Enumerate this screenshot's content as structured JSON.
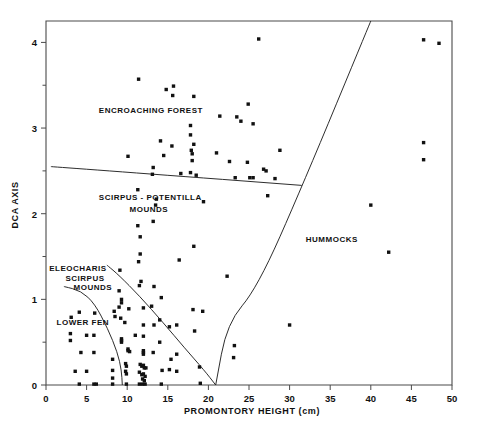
{
  "chart_data": {
    "type": "scatter",
    "title": "",
    "xlabel": "PROMONTORY HEIGHT (cm)",
    "ylabel": "DCA AXIS",
    "xlim": [
      0,
      50
    ],
    "ylim": [
      0,
      4.25
    ],
    "grid": false,
    "legend_position": "none",
    "xticks": [
      0,
      5,
      10,
      15,
      20,
      25,
      30,
      35,
      40,
      45,
      50
    ],
    "xtick_labels": [
      "0",
      "5",
      "10",
      "15",
      "20",
      "25",
      "30",
      "35",
      "40",
      "45",
      "50"
    ],
    "yticks": [
      0,
      1,
      2,
      3,
      4
    ],
    "ytick_labels": [
      "0",
      "1",
      "2",
      "3",
      "4"
    ],
    "yminorticks": [
      0.5,
      1.5,
      2.5,
      3.5
    ],
    "marker": "filled-square",
    "marker_color": "#111111",
    "annotations": [
      {
        "text": "ENCROACHING FOREST",
        "x": 6.5,
        "y": 3.18,
        "align": "start"
      },
      {
        "text": "SCIRPUS - POTENTILLA",
        "x": 6.5,
        "y": 2.16,
        "align": "start"
      },
      {
        "text": "MOUNDS",
        "x": 10.3,
        "y": 2.02,
        "align": "start"
      },
      {
        "text": "ELEOCHARIS",
        "x": 0.4,
        "y": 1.33,
        "align": "start"
      },
      {
        "text": "SCIRPUS",
        "x": 2.4,
        "y": 1.22,
        "align": "start"
      },
      {
        "text": "MOUNDS",
        "x": 3.4,
        "y": 1.11,
        "align": "start"
      },
      {
        "text": "LOWER FEN",
        "x": 1.3,
        "y": 0.7,
        "align": "start"
      },
      {
        "text": "HUMMOCKS",
        "x": 32.0,
        "y": 1.67,
        "align": "start"
      }
    ],
    "boundaries": [
      {
        "name": "forest-boundary",
        "points": [
          [
            0.6,
            2.55
          ],
          [
            12.0,
            2.47
          ],
          [
            31.5,
            2.33
          ]
        ]
      },
      {
        "name": "hummocks-boundary",
        "points": [
          [
            40.0,
            4.25
          ],
          [
            31.6,
            2.33
          ],
          [
            26.0,
            1.13
          ],
          [
            22.3,
            0.72
          ],
          [
            20.9,
            0.0
          ]
        ]
      },
      {
        "name": "eleocharis-scirpus-boundary",
        "points": [
          [
            7.5,
            1.4
          ],
          [
            9.0,
            1.28
          ],
          [
            11.5,
            1.04
          ],
          [
            14.5,
            0.72
          ],
          [
            17.0,
            0.44
          ],
          [
            19.5,
            0.17
          ],
          [
            20.9,
            0.0
          ]
        ]
      },
      {
        "name": "lower-fen-boundary",
        "points": [
          [
            2.2,
            1.15
          ],
          [
            4.3,
            1.1
          ],
          [
            6.0,
            0.95
          ],
          [
            7.6,
            0.66
          ],
          [
            8.8,
            0.38
          ],
          [
            9.3,
            0.17
          ],
          [
            9.4,
            0.0
          ]
        ]
      }
    ],
    "points": [
      [
        26.2,
        4.04
      ],
      [
        46.5,
        4.03
      ],
      [
        48.4,
        3.99
      ],
      [
        11.4,
        3.57
      ],
      [
        15.7,
        3.49
      ],
      [
        14.8,
        3.45
      ],
      [
        15.6,
        3.38
      ],
      [
        18.2,
        3.37
      ],
      [
        24.9,
        3.28
      ],
      [
        21.4,
        3.14
      ],
      [
        23.5,
        3.13
      ],
      [
        24.0,
        3.08
      ],
      [
        25.5,
        3.05
      ],
      [
        17.8,
        3.03
      ],
      [
        17.8,
        2.92
      ],
      [
        14.1,
        2.85
      ],
      [
        18.2,
        2.81
      ],
      [
        15.5,
        2.79
      ],
      [
        46.5,
        2.83
      ],
      [
        17.9,
        2.74
      ],
      [
        18.0,
        2.7
      ],
      [
        21.0,
        2.71
      ],
      [
        28.8,
        2.74
      ],
      [
        14.5,
        2.68
      ],
      [
        10.1,
        2.67
      ],
      [
        18.0,
        2.62
      ],
      [
        22.6,
        2.61
      ],
      [
        24.8,
        2.6
      ],
      [
        46.5,
        2.63
      ],
      [
        26.8,
        2.52
      ],
      [
        27.1,
        2.5
      ],
      [
        13.2,
        2.54
      ],
      [
        13.1,
        2.46
      ],
      [
        17.8,
        2.48
      ],
      [
        16.6,
        2.47
      ],
      [
        18.5,
        2.45
      ],
      [
        23.3,
        2.42
      ],
      [
        25.1,
        2.42
      ],
      [
        25.5,
        2.42
      ],
      [
        28.2,
        2.41
      ],
      [
        11.3,
        2.28
      ],
      [
        27.3,
        2.21
      ],
      [
        19.4,
        2.14
      ],
      [
        13.6,
        2.17
      ],
      [
        13.5,
        2.1
      ],
      [
        40.0,
        2.1
      ],
      [
        11.3,
        1.86
      ],
      [
        13.2,
        1.91
      ],
      [
        11.6,
        1.73
      ],
      [
        18.2,
        1.62
      ],
      [
        42.2,
        1.55
      ],
      [
        11.6,
        1.53
      ],
      [
        11.4,
        1.44
      ],
      [
        16.4,
        1.46
      ],
      [
        9.1,
        1.34
      ],
      [
        22.3,
        1.27
      ],
      [
        11.7,
        1.21
      ],
      [
        11.5,
        1.16
      ],
      [
        13.3,
        1.15
      ],
      [
        9.0,
        1.1
      ],
      [
        14.2,
        1.02
      ],
      [
        9.3,
        1.0
      ],
      [
        9.3,
        0.96
      ],
      [
        9.0,
        0.91
      ],
      [
        10.2,
        0.89
      ],
      [
        12.0,
        0.9
      ],
      [
        13.0,
        0.92
      ],
      [
        18.1,
        0.88
      ],
      [
        19.3,
        0.86
      ],
      [
        8.4,
        0.86
      ],
      [
        4.1,
        0.85
      ],
      [
        6.0,
        0.84
      ],
      [
        8.5,
        0.8
      ],
      [
        9.2,
        0.78
      ],
      [
        3.1,
        0.79
      ],
      [
        14.0,
        0.76
      ],
      [
        9.7,
        0.73
      ],
      [
        12.0,
        0.7
      ],
      [
        13.3,
        0.7
      ],
      [
        16.1,
        0.7
      ],
      [
        15.2,
        0.68
      ],
      [
        30.0,
        0.7
      ],
      [
        18.3,
        0.63
      ],
      [
        3.0,
        0.6
      ],
      [
        5.0,
        0.58
      ],
      [
        5.9,
        0.58
      ],
      [
        11.0,
        0.58
      ],
      [
        12.0,
        0.57
      ],
      [
        3.0,
        0.52
      ],
      [
        9.3,
        0.54
      ],
      [
        9.3,
        0.5
      ],
      [
        9.3,
        0.52
      ],
      [
        14.0,
        0.5
      ],
      [
        23.2,
        0.46
      ],
      [
        10.1,
        0.42
      ],
      [
        10.1,
        0.4
      ],
      [
        10.3,
        0.39
      ],
      [
        4.3,
        0.38
      ],
      [
        5.9,
        0.38
      ],
      [
        12.0,
        0.4
      ],
      [
        12.0,
        0.38
      ],
      [
        12.0,
        0.36
      ],
      [
        13.2,
        0.38
      ],
      [
        16.1,
        0.36
      ],
      [
        23.1,
        0.32
      ],
      [
        15.4,
        0.3
      ],
      [
        8.2,
        0.3
      ],
      [
        9.8,
        0.25
      ],
      [
        9.9,
        0.22
      ],
      [
        11.6,
        0.24
      ],
      [
        11.8,
        0.22
      ],
      [
        12.0,
        0.23
      ],
      [
        12.1,
        0.2
      ],
      [
        12.3,
        0.2
      ],
      [
        18.9,
        0.21
      ],
      [
        15.2,
        0.18
      ],
      [
        16.1,
        0.16
      ],
      [
        3.6,
        0.16
      ],
      [
        5.0,
        0.16
      ],
      [
        8.2,
        0.17
      ],
      [
        9.8,
        0.16
      ],
      [
        9.9,
        0.13
      ],
      [
        11.5,
        0.15
      ],
      [
        11.8,
        0.12
      ],
      [
        12.0,
        0.13
      ],
      [
        12.2,
        0.1
      ],
      [
        14.3,
        0.17
      ],
      [
        8.2,
        0.08
      ],
      [
        11.9,
        0.07
      ],
      [
        12.1,
        0.05
      ],
      [
        4.1,
        0.01
      ],
      [
        5.9,
        0.01
      ],
      [
        6.2,
        0.01
      ],
      [
        8.2,
        0.01
      ],
      [
        9.9,
        0.01
      ],
      [
        11.5,
        0.01
      ],
      [
        11.9,
        0.01
      ],
      [
        12.2,
        0.01
      ],
      [
        14.2,
        0.01
      ],
      [
        19.0,
        0.02
      ]
    ]
  }
}
